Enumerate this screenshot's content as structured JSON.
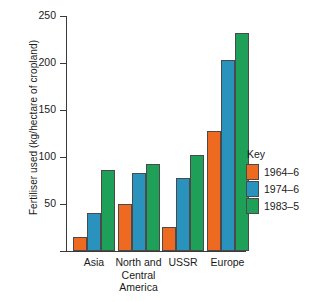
{
  "chart_data": {
    "type": "bar",
    "title": "",
    "xlabel": "",
    "ylabel": "Fertiliser used (kg/hectare of cropland)",
    "ylim": [
      0,
      250
    ],
    "yticks": [
      0,
      50,
      100,
      150,
      200,
      250
    ],
    "ytick_labels": [
      "",
      "50",
      "100",
      "150",
      "200",
      "250"
    ],
    "grid": false,
    "legend_position": "right",
    "legend_title": "Key",
    "categories": [
      "Asia",
      "North and Central America",
      "USSR",
      "Europe"
    ],
    "category_lines": [
      [
        "Asia"
      ],
      [
        "North and",
        "Central",
        "America"
      ],
      [
        "USSR"
      ],
      [
        "Europe"
      ]
    ],
    "series": [
      {
        "name": "1964–6",
        "color": "#ee6a20",
        "values": [
          15,
          50,
          26,
          128
        ]
      },
      {
        "name": "1974–6",
        "color": "#2a93bd",
        "values": [
          40,
          83,
          78,
          203
        ]
      },
      {
        "name": "1983–5",
        "color": "#1fa058",
        "values": [
          86,
          93,
          102,
          232
        ]
      }
    ]
  },
  "axis": {
    "tick_250": "250",
    "tick_200": "200",
    "tick_150": "150",
    "tick_100": "100",
    "tick_50": "50"
  },
  "legend": {
    "title": "Key",
    "items": [
      {
        "label": "1964–6",
        "color": "#ee6a20"
      },
      {
        "label": "1974–6",
        "color": "#2a93bd"
      },
      {
        "label": "1983–5",
        "color": "#1fa058"
      }
    ]
  }
}
